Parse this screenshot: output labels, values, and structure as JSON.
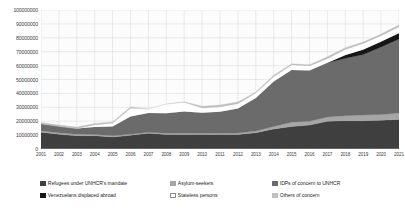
{
  "chart_data": {
    "type": "area",
    "stacked": true,
    "title": "",
    "xlabel": "",
    "ylabel": "",
    "grid": true,
    "legend_position": "bottom",
    "ylim": [
      0,
      100000000
    ],
    "yticks": [
      0,
      10000000,
      20000000,
      30000000,
      40000000,
      50000000,
      60000000,
      70000000,
      80000000,
      90000000,
      100000000
    ],
    "ytick_labels": [
      "0",
      "10000000",
      "20000000",
      "30000000",
      "40000000",
      "50000000",
      "60000000",
      "70000000",
      "80000000",
      "90000000",
      "100000000"
    ],
    "categories": [
      "2001",
      "2002",
      "2003",
      "2004",
      "2005",
      "2006",
      "2007",
      "2008",
      "2009",
      "2010",
      "2011",
      "2012",
      "2013",
      "2014",
      "2015",
      "2016",
      "2017",
      "2018",
      "2019",
      "2020",
      "2021"
    ],
    "series": [
      {
        "name": "Refugees under UNHCR's mandate",
        "color": "#3f3f3f",
        "values": [
          12100000,
          10600000,
          9600000,
          9600000,
          8700000,
          9900000,
          11400000,
          10500000,
          10400000,
          10500000,
          10400000,
          10500000,
          11700000,
          14400000,
          16100000,
          17200000,
          19900000,
          20400000,
          20400000,
          20700000,
          21300000
        ]
      },
      {
        "name": "Asylum-seekers",
        "color": "#a6a6a6",
        "values": [
          940000,
          1050000,
          1000000,
          885000,
          800000,
          740000,
          740000,
          830000,
          1000000,
          840000,
          900000,
          940000,
          1170000,
          1800000,
          3220000,
          2730000,
          3090000,
          3500000,
          4150000,
          4140000,
          4620000
        ]
      },
      {
        "name": "IDPs of concern to UNHCR",
        "color": "#6b6b6b",
        "values": [
          5100000,
          4650000,
          4180000,
          5420000,
          6620000,
          12800000,
          13700000,
          14400000,
          15600000,
          14700000,
          15500000,
          17700000,
          23900000,
          32300000,
          37500000,
          36600000,
          39100000,
          41400000,
          43500000,
          48600000,
          53200000
        ]
      },
      {
        "name": "Venezuelans displaced abroad",
        "color": "#161616",
        "values": [
          0,
          0,
          0,
          0,
          0,
          0,
          0,
          0,
          0,
          0,
          0,
          0,
          0,
          0,
          0,
          0,
          0,
          2400000,
          3600000,
          3900000,
          4400000
        ]
      },
      {
        "name": "Stateless persons",
        "color": "#ffffff",
        "values": [
          0,
          0,
          0,
          1450000,
          2400000,
          5800000,
          2900000,
          6570000,
          6560000,
          3460000,
          3480000,
          3340000,
          3470000,
          3490000,
          3680000,
          3240000,
          2840000,
          3900000,
          4160000,
          4180000,
          4300000
        ]
      },
      {
        "name": "Others of concern",
        "color": "#bfbfbf",
        "values": [
          940000,
          1040000,
          990000,
          1060000,
          960000,
          1000000,
          70000,
          70000,
          410000,
          1260000,
          1400000,
          1300000,
          840000,
          1100000,
          800000,
          800000,
          1400000,
          1200000,
          1200000,
          1200000,
          1300000
        ]
      }
    ]
  },
  "legend": {
    "items": [
      {
        "label": "Refugees under UNHCR's mandate",
        "color": "#3f3f3f",
        "row": 0,
        "col": 0
      },
      {
        "label": "Asylum-seekers",
        "color": "#a6a6a6",
        "row": 0,
        "col": 1
      },
      {
        "label": "IDPs of concern to UNHCR",
        "color": "#6b6b6b",
        "row": 0,
        "col": 2
      },
      {
        "label": "Venezuelans displaced abroad",
        "color": "#161616",
        "row": 1,
        "col": 0
      },
      {
        "label": "Stateless persons",
        "color": "#ffffff",
        "row": 1,
        "col": 1
      },
      {
        "label": "Others of concern",
        "color": "#bfbfbf",
        "row": 1,
        "col": 2
      }
    ]
  },
  "colors": {
    "plot_background": "#fcfcfc",
    "gridline": "#d9d9d9",
    "axis_text": "#404040",
    "legend_text": "#262626"
  }
}
